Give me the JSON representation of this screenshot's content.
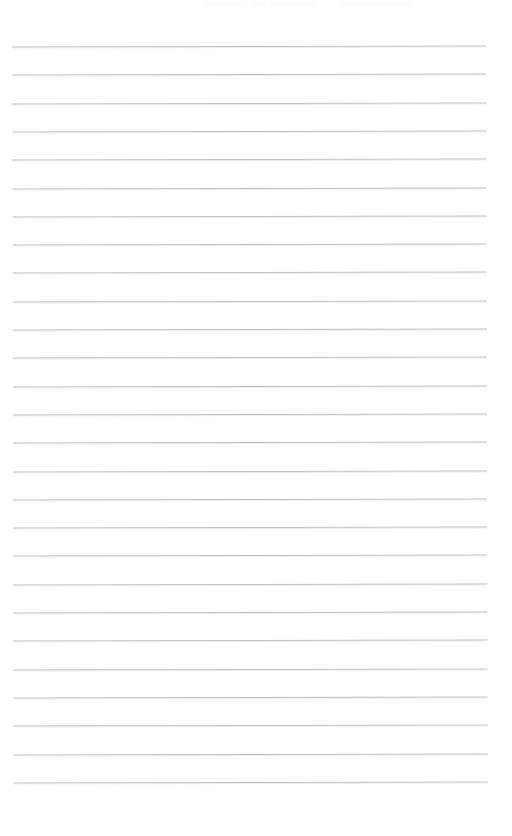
{
  "document": {
    "kind": "scanned-ruled-notepad-page",
    "title": "Blank ruled notepad page",
    "page_width": 512,
    "page_height": 836,
    "paper_color": "#ffffff",
    "rule_color": "#b9bdc1",
    "rule_bleed_color": "#dcdee0",
    "rule_thickness": 1,
    "rule_left": 13,
    "rule_right": 487,
    "rule_spacing": 28.3,
    "first_rule_y": 46,
    "last_rule_y": 782,
    "rule_count": 27,
    "skew_degrees": -0.12,
    "written_text": "",
    "body_text_lines": [
      "",
      "",
      "",
      "",
      "",
      "",
      "",
      "",
      "",
      "",
      "",
      "",
      "",
      "",
      "",
      "",
      "",
      "",
      "",
      "",
      "",
      "",
      "",
      "",
      "",
      "",
      ""
    ],
    "rule_y_positions": [
      46,
      74.3,
      102.6,
      130.9,
      159.2,
      187.5,
      215.8,
      244.1,
      272.4,
      300.7,
      329,
      357.3,
      385.6,
      413.9,
      442.2,
      470.5,
      498.8,
      527.1,
      555.4,
      583.7,
      612,
      640.3,
      668.6,
      696.9,
      725.2,
      753.5,
      781.8
    ],
    "top_edge_artifacts": [
      {
        "left": 205,
        "width": 42,
        "label": "cropped-header-smudge-left"
      },
      {
        "left": 252,
        "width": 14,
        "label": "cropped-header-smudge-mid"
      },
      {
        "left": 270,
        "width": 48,
        "label": "cropped-header-smudge-right"
      },
      {
        "left": 340,
        "width": 72,
        "label": "cropped-header-smudge-far-right"
      }
    ]
  }
}
